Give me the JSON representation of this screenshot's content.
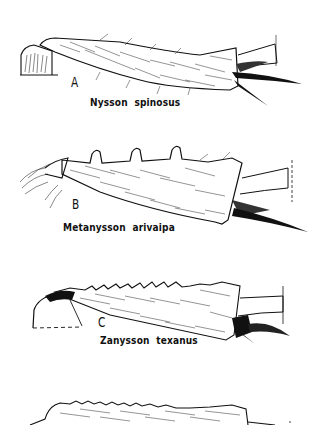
{
  "figure": {
    "panels": [
      {
        "letter": "A",
        "species": "Nysson  spinosus"
      },
      {
        "letter": "B",
        "species": "Metanysson  arivaipa"
      },
      {
        "letter": "C",
        "species": "Zanysson  texanus"
      },
      {
        "letter": "",
        "species": ""
      }
    ],
    "colors": {
      "ink": "#111111",
      "paper": "#ffffff"
    }
  }
}
